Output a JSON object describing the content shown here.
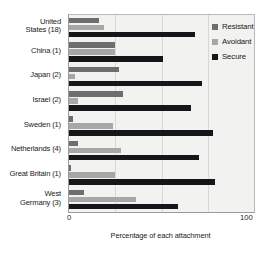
{
  "chart_data": {
    "type": "bar",
    "orientation": "horizontal",
    "title": "",
    "xlabel": "Percentage of each attachment",
    "ylabel": "",
    "xlim": [
      0,
      100
    ],
    "xticks": [
      0,
      100
    ],
    "xtick_labels": [
      "0",
      "100"
    ],
    "grid": true,
    "grid_axis": "x",
    "legend_position": "top-right",
    "categories": [
      "United\nStates (18)",
      "China (1)",
      "Japan (2)",
      "Israel (2)",
      "Sweden (1)",
      "Netherlands (4)",
      "Great Britain (1)",
      "West\nGermany (3)"
    ],
    "series": [
      {
        "name": "Resistant",
        "color": "#6e6e6e",
        "values": [
          16,
          25,
          27,
          29,
          2,
          5,
          1,
          8
        ]
      },
      {
        "name": "Avoidant",
        "color": "#a7a7a7",
        "values": [
          19,
          25,
          3,
          5,
          24,
          28,
          25,
          36
        ]
      },
      {
        "name": "Secure",
        "color": "#16161a",
        "values": [
          68,
          51,
          72,
          66,
          78,
          70,
          79,
          59
        ]
      }
    ]
  },
  "legend": {
    "items": [
      {
        "label": "Resistant",
        "color": "#6e6e6e"
      },
      {
        "label": "Avoidant",
        "color": "#a7a7a7"
      },
      {
        "label": "Secure",
        "color": "#16161a"
      }
    ]
  },
  "axis": {
    "x_min_label": "0",
    "x_max_label": "100",
    "x_title": "Percentage of each attachment"
  }
}
